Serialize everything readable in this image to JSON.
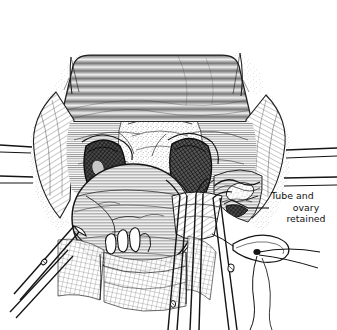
{
  "figure": {
    "number": "3",
    "domain_kind": "surgical-atlas-line-engraving",
    "background_color": "#ffffff",
    "ink_color": "#1a1a1a"
  },
  "annotations": [
    {
      "id": "tube-and-ovary",
      "line_1": "Tube and",
      "line_2": "ovary",
      "line_3": "retained",
      "full_text": "Tube and ovary retained",
      "leader_line": true
    }
  ],
  "scene": {
    "title_text": "3",
    "description": "Pelvic surgical field, hysterectomy, viewed from above",
    "structures": [
      {
        "name": "bladder-flap",
        "label": ""
      },
      {
        "name": "uterine-corpus",
        "label": ""
      },
      {
        "name": "left-adnexal-cavity",
        "label": ""
      },
      {
        "name": "right-adnexal-cavity",
        "label": ""
      },
      {
        "name": "retained-tube-and-ovary",
        "label": "Tube and ovary retained"
      }
    ],
    "instruments": [
      {
        "name": "left-clamp",
        "label": ""
      },
      {
        "name": "center-clamp-pair",
        "label": ""
      },
      {
        "name": "right-clamp",
        "label": ""
      },
      {
        "name": "ligature-loop",
        "label": ""
      }
    ],
    "retractors": [
      {
        "name": "left-retractor-blade",
        "label": ""
      },
      {
        "name": "right-retractor-blade",
        "label": ""
      }
    ],
    "sutures": [
      {
        "name": "top-left-stay-suture",
        "label": ""
      },
      {
        "name": "top-right-stay-suture",
        "label": ""
      }
    ]
  }
}
